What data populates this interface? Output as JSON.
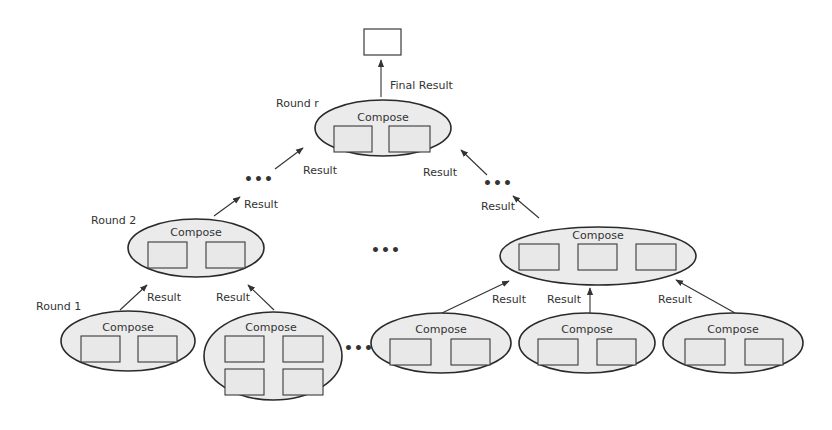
{
  "diagram": {
    "title_labels": {
      "final_result": "Final Result",
      "round_r": "Round r",
      "round_2": "Round 2",
      "round_1": "Round 1"
    },
    "compose_label": "Compose",
    "result_label": "Result",
    "ellipsis": "•••",
    "nodes": [
      {
        "id": "round-r",
        "label": "Compose",
        "cx": 383,
        "cy": 124,
        "rx": 68,
        "ry": 28,
        "boxes": 2
      },
      {
        "id": "round2-left",
        "label": "Compose",
        "cx": 203,
        "cy": 246,
        "rx": 68,
        "ry": 28,
        "boxes": 2
      },
      {
        "id": "round2-right",
        "label": "Compose",
        "cx": 597,
        "cy": 258,
        "rx": 98,
        "ry": 29,
        "boxes": 3
      },
      {
        "id": "round1-a",
        "label": "Compose",
        "cx": 128,
        "cy": 340,
        "rx": 67,
        "ry": 30,
        "boxes": 2
      },
      {
        "id": "round1-b",
        "label": "Compose",
        "cx": 273,
        "cy": 355,
        "rx": 69,
        "ry": 45,
        "boxes": 4
      },
      {
        "id": "round1-c",
        "label": "Compose",
        "cx": 441,
        "cy": 340,
        "rx": 70,
        "ry": 30,
        "boxes": 2
      },
      {
        "id": "round1-d",
        "label": "Compose",
        "cx": 587,
        "cy": 340,
        "rx": 68,
        "ry": 30,
        "boxes": 2
      },
      {
        "id": "round1-e",
        "label": "Compose",
        "cx": 733,
        "cy": 340,
        "rx": 70,
        "ry": 30,
        "boxes": 2
      }
    ],
    "edges": [
      {
        "from": "round-r",
        "to": "final-result",
        "label": "Final Result"
      },
      {
        "from": "ellipsis-left",
        "to": "round-r",
        "label": "Result"
      },
      {
        "from": "ellipsis-right",
        "to": "round-r",
        "label": "Result"
      },
      {
        "from": "round2-left",
        "to": "ellipsis-left",
        "label": "Result"
      },
      {
        "from": "round2-right",
        "to": "ellipsis-right",
        "label": "Result"
      },
      {
        "from": "round1-a",
        "to": "round2-left",
        "label": "Result"
      },
      {
        "from": "round1-b",
        "to": "round2-left",
        "label": "Result"
      },
      {
        "from": "round1-c",
        "to": "round2-right",
        "label": "Result"
      },
      {
        "from": "round1-d",
        "to": "round2-right",
        "label": "Result"
      },
      {
        "from": "round1-e",
        "to": "round2-right",
        "label": "Result"
      }
    ]
  }
}
